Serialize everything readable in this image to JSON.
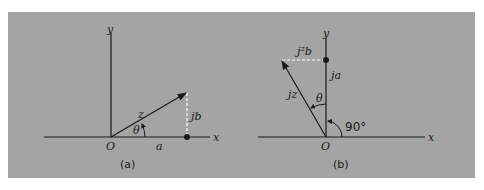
{
  "figure": {
    "background_color": "#a4a4a4",
    "line_color": "#1a1a1a",
    "dashed_color": "#ffffff",
    "panel_a": {
      "caption": "(a)",
      "x_axis_label": "x",
      "y_axis_label": "y",
      "origin_label": "O",
      "vector_label": "z",
      "angle_label": "θ",
      "real_part_label": "a",
      "imag_part_label": "jb"
    },
    "panel_b": {
      "caption": "(b)",
      "x_axis_label": "x",
      "y_axis_label": "y",
      "origin_label": "O",
      "vector_label": "jz",
      "angle_label": "θ",
      "right_angle_label": "90°",
      "imag_part_label": "ja",
      "real_part_label": "j²b"
    }
  }
}
